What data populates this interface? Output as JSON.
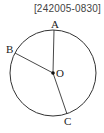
{
  "header": {
    "code": "[242005-0830]"
  },
  "diagram": {
    "circle": {
      "cx": 53,
      "cy": 73,
      "r": 43
    },
    "center": {
      "label": "O",
      "x": 53,
      "y": 73
    },
    "points": [
      {
        "label": "A",
        "x": 54,
        "y": 30
      },
      {
        "label": "B",
        "x": 15,
        "y": 53
      },
      {
        "label": "C",
        "x": 67,
        "y": 114
      }
    ],
    "segments": [
      "OA",
      "OB",
      "OC"
    ],
    "stroke_color": "#333333"
  }
}
